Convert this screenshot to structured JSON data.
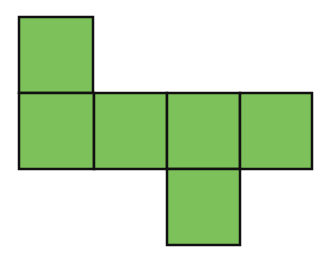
{
  "diagram": {
    "fill_color": "#7dc15a",
    "stroke_color": "#111111",
    "faces": [
      {
        "id": "top",
        "x": 19,
        "y": 17,
        "w": 74,
        "h": 76
      },
      {
        "id": "row-1",
        "x": 19,
        "y": 93,
        "w": 75,
        "h": 76
      },
      {
        "id": "row-2",
        "x": 94,
        "y": 93,
        "w": 73,
        "h": 76
      },
      {
        "id": "row-3",
        "x": 167,
        "y": 93,
        "w": 73,
        "h": 76
      },
      {
        "id": "row-4",
        "x": 240,
        "y": 93,
        "w": 72,
        "h": 76
      },
      {
        "id": "bottom",
        "x": 167,
        "y": 169,
        "w": 73,
        "h": 76
      }
    ]
  }
}
